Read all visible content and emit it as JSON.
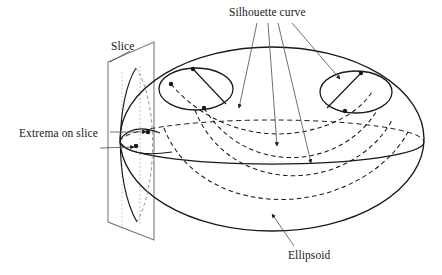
{
  "figure": {
    "title": "",
    "kind": "line-diagram",
    "background_color": "#ffffff",
    "stroke_color": "#1a1a1a",
    "width": 442,
    "height": 275
  },
  "labels": {
    "silhouette_curve": "Silhouette curve",
    "slice": "Slice",
    "extrema_on_slice": "Extrema on slice",
    "ellipsoid": "Ellipsoid"
  },
  "diagram_data": {
    "type": "geometric-illustration",
    "subject": "Ellipsoid with cutting slice plane, silhouette curves and extrema points",
    "elements": [
      {
        "name": "ellipsoid-outline",
        "shape": "ellipse",
        "center": [
          272,
          139
        ],
        "radii": [
          152,
          92
        ],
        "style": "solid"
      },
      {
        "name": "equator",
        "shape": "ellipse",
        "center": [
          272,
          142
        ],
        "radii": [
          152,
          22
        ],
        "front_half": "solid",
        "back_half": "dashed"
      },
      {
        "name": "slice-plane",
        "shape": "parallelogram",
        "corners": [
          [
            108,
            62
          ],
          [
            154,
            42
          ],
          [
            154,
            240
          ],
          [
            108,
            222
          ]
        ],
        "style": "solid"
      },
      {
        "name": "slice-intersection-curve",
        "shape": "arc",
        "style": "solid"
      },
      {
        "name": "slice-hidden-curve",
        "shape": "arc",
        "style": "dashed"
      },
      {
        "name": "small-ellipse-left",
        "shape": "ellipse",
        "center": [
          196,
          89
        ],
        "radii": [
          37,
          21
        ],
        "style": "solid",
        "marker_points": [
          [
            193,
            69
          ],
          [
            171,
            84
          ],
          [
            204,
            108
          ],
          [
            226,
            92
          ]
        ],
        "chord": [
          [
            193,
            69
          ],
          [
            226,
            105
          ]
        ]
      },
      {
        "name": "small-ellipse-right",
        "shape": "ellipse",
        "center": [
          356,
          92
        ],
        "radii": [
          36,
          21
        ],
        "style": "solid",
        "marker_points": [
          [
            361,
            73
          ],
          [
            345,
            111
          ]
        ],
        "chord": [
          [
            361,
            73
          ],
          [
            327,
            108
          ]
        ]
      },
      {
        "name": "silhouette-curve-1",
        "shape": "u-curve",
        "style": "dashed"
      },
      {
        "name": "silhouette-curve-2",
        "shape": "u-curve",
        "style": "dashed"
      },
      {
        "name": "silhouette-curve-3",
        "shape": "u-curve",
        "style": "dashed"
      },
      {
        "name": "silhouette-curve-4",
        "shape": "u-curve",
        "style": "dashed"
      },
      {
        "name": "extrema-point-upper",
        "shape": "point",
        "at": [
          148,
          132
        ]
      },
      {
        "name": "extrema-point-lower",
        "shape": "point",
        "at": [
          136,
          146
        ]
      }
    ],
    "leader_lines": [
      {
        "from_label": "silhouette_curve",
        "to": [
          239,
          108
        ],
        "arrowhead": true
      },
      {
        "from_label": "silhouette_curve",
        "to": [
          277,
          145
        ],
        "arrowhead": true
      },
      {
        "from_label": "silhouette_curve",
        "to": [
          310,
          162
        ],
        "arrowhead": true
      },
      {
        "from_label": "silhouette_curve",
        "to": [
          338,
          78
        ],
        "arrowhead": true
      },
      {
        "from_label": "slice",
        "to": [
          125,
          90
        ],
        "arrowhead": false
      },
      {
        "from_label": "extrema_on_slice",
        "to": [
          148,
          132
        ],
        "arrowhead": true
      },
      {
        "from_label": "extrema_on_slice",
        "to": [
          136,
          146
        ],
        "arrowhead": true
      },
      {
        "from_label": "ellipsoid",
        "to": [
          273,
          215
        ],
        "arrowhead": true
      }
    ]
  }
}
